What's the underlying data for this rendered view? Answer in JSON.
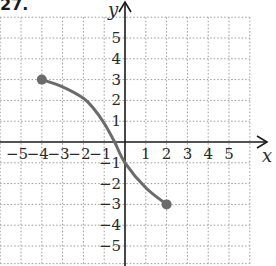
{
  "problem_number": "27.",
  "chart_data": {
    "type": "line",
    "title": "",
    "xlabel": "x",
    "ylabel": "y",
    "xlim": [
      -6,
      6
    ],
    "ylim": [
      -6,
      6
    ],
    "grid": true,
    "grid_style": "dotted",
    "x_ticks": [
      -5,
      -4,
      -3,
      -2,
      -1,
      1,
      2,
      3,
      4,
      5
    ],
    "y_ticks": [
      5,
      4,
      3,
      2,
      1,
      -1,
      -2,
      -3,
      -4,
      -5
    ],
    "x_tick_labels": [
      "−5",
      "−4",
      "−3",
      "−2",
      "−1",
      "1",
      "2",
      "3",
      "4",
      "5"
    ],
    "y_tick_labels": [
      "5",
      "4",
      "3",
      "2",
      "1",
      "−1",
      "−2",
      "−3",
      "−4",
      "−5"
    ],
    "series": [
      {
        "name": "f(x)",
        "color": "#6b6b6b",
        "x": [
          -4,
          -3,
          -2,
          -1.5,
          -1,
          -0.5,
          0,
          1,
          2
        ],
        "y": [
          3,
          2.65,
          2.1,
          1.6,
          0.9,
          0,
          -1,
          -2.2,
          -3
        ],
        "endpoints": [
          {
            "x": -4,
            "y": 3,
            "closed": true
          },
          {
            "x": 2,
            "y": -3,
            "closed": true
          }
        ]
      }
    ],
    "legend": null
  }
}
